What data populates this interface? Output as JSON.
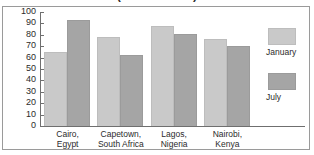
{
  "chart_data": {
    "type": "bar",
    "title": "(in Fahrenheit)",
    "xlabel": "",
    "ylabel": "",
    "ylim": [
      0,
      100
    ],
    "ytick_labels": [
      "100",
      "90",
      "80",
      "70",
      "60",
      "50",
      "40",
      "30",
      "20",
      "10",
      "0"
    ],
    "yticks": [
      100,
      90,
      80,
      70,
      60,
      50,
      40,
      30,
      20,
      10,
      0
    ],
    "grid": false,
    "legend_position": "right",
    "categories": [
      "Cairo, Egypt",
      "Capetown, South Africa",
      "Lagos, Nigeria",
      "Nairobi, Kenya"
    ],
    "category_lines": [
      [
        "Cairo,",
        "Egypt"
      ],
      [
        "Capetown,",
        "South Africa"
      ],
      [
        "Lagos,",
        "Nigeria"
      ],
      [
        "Nairobi,",
        "Kenya"
      ]
    ],
    "series": [
      {
        "name": "January",
        "color": "#c9c9c9",
        "values": [
          65,
          78,
          88,
          76
        ]
      },
      {
        "name": "July",
        "color": "#a5a5a5",
        "values": [
          93,
          62,
          81,
          70
        ]
      }
    ]
  },
  "legend": {
    "entries": [
      {
        "label": "January",
        "color": "#c9c9c9"
      },
      {
        "label": "July",
        "color": "#a5a5a5"
      }
    ]
  },
  "colors": {
    "january": "#c9c9c9",
    "july": "#a5a5a5",
    "axis": "#6f6f6f",
    "frame": "#9a9a9a",
    "text": "#2b2b2b",
    "background": "#ffffff"
  }
}
